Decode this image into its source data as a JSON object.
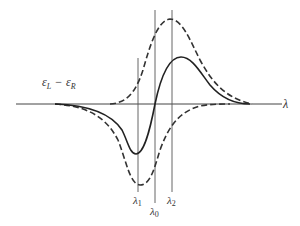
{
  "diagram": {
    "y_label": "ε_L − ε_R",
    "y_label_main_left": "ε",
    "y_label_sub_left": "L",
    "y_label_minus": "−",
    "y_label_main_right": "ε",
    "y_label_sub_right": "R",
    "x_axis_label": "λ",
    "markers": [
      {
        "main": "λ",
        "sub": "1",
        "x": 138
      },
      {
        "main": "λ",
        "sub": "0",
        "x": 155
      },
      {
        "main": "λ",
        "sub": "2",
        "x": 172
      }
    ],
    "curves": [
      {
        "name": "upper-dashed-absorption",
        "style": "dashed"
      },
      {
        "name": "lower-dashed-absorption",
        "style": "dashed"
      },
      {
        "name": "solid-difference-curve",
        "style": "solid"
      }
    ],
    "colors": {
      "line": "#333333",
      "background": "#ffffff"
    }
  }
}
